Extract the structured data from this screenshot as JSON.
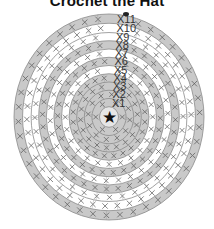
{
  "title": "Crochet the Hat",
  "diagram": {
    "center": {
      "x": 109,
      "y": 117
    },
    "radius_x": 95,
    "radius_y": 103,
    "center_symbol": "star-icon",
    "center_symbol_char": "★",
    "colors": {
      "gray_band": "#c9c9c9",
      "white_band": "#ffffff",
      "stroke": "#8a8a8a",
      "stitch": "#555555",
      "center_fill": "#e6e6e6"
    },
    "rounds": [
      {
        "label": "X1",
        "fill": "gray",
        "r": 18,
        "stitches": 6
      },
      {
        "label": "X2",
        "fill": "gray",
        "r": 26,
        "stitches": 12
      },
      {
        "label": "X3",
        "fill": "gray",
        "r": 34,
        "stitches": 18
      },
      {
        "label": "X4",
        "fill": "gray",
        "r": 42,
        "stitches": 24
      },
      {
        "label": "X5",
        "fill": "white",
        "r": 50,
        "stitches": 24
      },
      {
        "label": "X6",
        "fill": "gray",
        "r": 58,
        "stitches": 30
      },
      {
        "label": "X7",
        "fill": "white",
        "r": 66,
        "stitches": 30
      },
      {
        "label": "X8",
        "fill": "gray",
        "r": 74,
        "stitches": 36
      },
      {
        "label": "X9",
        "fill": "white",
        "r": 82,
        "stitches": 36
      },
      {
        "label": "X10",
        "fill": "white",
        "r": 91,
        "stitches": 42
      },
      {
        "label": "X11",
        "fill": "gray",
        "r": 100,
        "stitches": 42
      }
    ],
    "start_marker": {
      "x": 126,
      "y": 14
    }
  }
}
